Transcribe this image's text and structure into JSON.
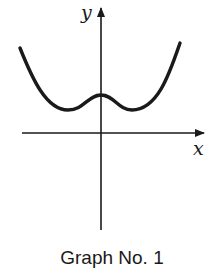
{
  "figure": {
    "caption": "Graph No. 1",
    "x_axis_label": "x",
    "y_axis_label": "y",
    "stroke_color": "#1a1a1a",
    "background": "#ffffff"
  },
  "diagram": {
    "type": "function-sketch",
    "features": {
      "symmetry": "even (about y-axis)",
      "local_minima": 2,
      "local_maxima": 1,
      "local_max_location": "on y-axis, above x-axis",
      "x_intercepts": 0,
      "y_intercept": "positive",
      "end_behavior": "increasing to +infinity on both sides"
    }
  }
}
